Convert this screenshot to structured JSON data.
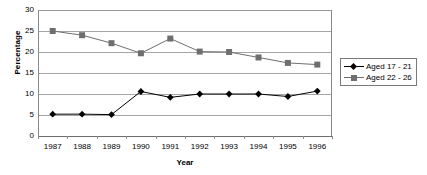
{
  "chart_data": {
    "type": "line",
    "title": "",
    "xlabel": "Year",
    "ylabel": "Percentage",
    "categories": [
      "1987",
      "1988",
      "1989",
      "1990",
      "1991",
      "1992",
      "1993",
      "1994",
      "1995",
      "1996"
    ],
    "ylim": [
      0,
      30
    ],
    "ytick_step": 5,
    "yticks": [
      "30",
      "25",
      "20",
      "15",
      "10",
      "5",
      "0"
    ],
    "grid": true,
    "legend_position": "right",
    "series": [
      {
        "name": "Aged 17 - 21",
        "marker": "diamond",
        "color": "#000000",
        "values": [
          5.2,
          5.2,
          5.1,
          10.6,
          9.2,
          10.0,
          10.0,
          10.0,
          9.4,
          10.7
        ]
      },
      {
        "name": "Aged 22 - 26",
        "marker": "square",
        "color": "#6f6f6f",
        "values": [
          25.0,
          24.0,
          22.1,
          19.7,
          23.2,
          20.1,
          20.0,
          18.7,
          17.4,
          17.0
        ]
      }
    ]
  },
  "axes": {
    "y_title": "Percentage",
    "x_title": "Year"
  },
  "legend": {
    "items": [
      {
        "label": "Aged 17 - 21"
      },
      {
        "label": "Aged 22 - 26"
      }
    ]
  },
  "colors": {
    "series1": "#000000",
    "series2": "#6f6f6f",
    "grid": "#a6a6a6",
    "axis": "#8a8a8a",
    "background": "#ffffff"
  }
}
